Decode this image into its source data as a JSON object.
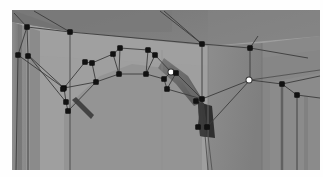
{
  "app": {
    "view_name": "3d-photogrammetry-viewport",
    "title": "Stone Archway Mesh Overlay",
    "description": "Oblique photograph of a masonry arch with an editable polygonal wireframe mesh overlaid; black square handles mark mesh vertices, white round handles mark the currently selected vertices."
  },
  "canvas": {
    "width": 323,
    "height": 177,
    "viewport_x": 12,
    "viewport_y": 10,
    "viewport_width": 308,
    "viewport_height": 160,
    "page_background": "#ffffff"
  },
  "palette": {
    "wall_face": "#9b9b9b",
    "wall_face_light": "#a6a6a6",
    "upper_band": "#7e7e7e",
    "upper_band_dark": "#767676",
    "left_pier": "#8a8a8a",
    "left_pier_dark": "#7c7c7c",
    "right_wall": "#8d8d8d",
    "right_wall_dark": "#828282",
    "right_return": "#898989",
    "soffit_shadow": "#6e6e6e",
    "voussoir_shadow": "#585858",
    "pier_shadow": "#3a3a3a",
    "dark_jamb": "#2e2e2e",
    "wire_stroke": "#3b3b3b",
    "wire_stroke_soft": "#4a4a4a",
    "vertex_fill": "#111111",
    "vertex_selected_fill": "#ffffff",
    "vertex_selected_stroke": "#282828"
  },
  "mesh": {
    "vertex_count": 30,
    "selected_vertex_count": 2,
    "vertices": [
      {
        "id": "v01",
        "x": 27,
        "y": 27,
        "state": "normal",
        "group": "upper-left-corner"
      },
      {
        "id": "v02",
        "x": 70,
        "y": 32,
        "state": "normal",
        "group": "upper-band"
      },
      {
        "id": "v03",
        "x": 18,
        "y": 55,
        "state": "normal",
        "group": "left-pier-top"
      },
      {
        "id": "v04",
        "x": 28,
        "y": 56,
        "state": "normal",
        "group": "left-pier-top"
      },
      {
        "id": "v05",
        "x": 64,
        "y": 88,
        "state": "normal",
        "group": "left-springer"
      },
      {
        "id": "v06",
        "x": 66,
        "y": 102,
        "state": "normal",
        "group": "left-springer"
      },
      {
        "id": "v07",
        "x": 68,
        "y": 111,
        "state": "normal",
        "group": "left-impost"
      },
      {
        "id": "v08",
        "x": 85,
        "y": 62,
        "state": "normal",
        "group": "arch-extrados"
      },
      {
        "id": "v09",
        "x": 92,
        "y": 63,
        "state": "normal",
        "group": "arch-extrados"
      },
      {
        "id": "v10",
        "x": 96,
        "y": 82,
        "state": "normal",
        "group": "arch-intrados"
      },
      {
        "id": "v11",
        "x": 113,
        "y": 54,
        "state": "normal",
        "group": "arch-extrados"
      },
      {
        "id": "v12",
        "x": 119,
        "y": 74,
        "state": "normal",
        "group": "arch-intrados"
      },
      {
        "id": "v13",
        "x": 120,
        "y": 48,
        "state": "normal",
        "group": "arch-crown"
      },
      {
        "id": "v14",
        "x": 148,
        "y": 50,
        "state": "normal",
        "group": "arch-crown"
      },
      {
        "id": "v15",
        "x": 146,
        "y": 74,
        "state": "normal",
        "group": "arch-intrados"
      },
      {
        "id": "v16",
        "x": 155,
        "y": 55,
        "state": "normal",
        "group": "arch-extrados"
      },
      {
        "id": "v17",
        "x": 164,
        "y": 79,
        "state": "normal",
        "group": "arch-intrados"
      },
      {
        "id": "v18",
        "x": 171,
        "y": 72,
        "state": "selected",
        "group": "arch-extrados"
      },
      {
        "id": "v19",
        "x": 176,
        "y": 73,
        "state": "normal",
        "group": "arch-extrados"
      },
      {
        "id": "v20",
        "x": 167,
        "y": 89,
        "state": "normal",
        "group": "arch-intrados"
      },
      {
        "id": "v21",
        "x": 202,
        "y": 44,
        "state": "normal",
        "group": "right-wall-top"
      },
      {
        "id": "v22",
        "x": 202,
        "y": 99,
        "state": "normal",
        "group": "right-springer"
      },
      {
        "id": "v23",
        "x": 198,
        "y": 127,
        "state": "normal",
        "group": "right-pier-base"
      },
      {
        "id": "v24",
        "x": 207,
        "y": 127,
        "state": "normal",
        "group": "right-pier-base"
      },
      {
        "id": "v25",
        "x": 250,
        "y": 48,
        "state": "normal",
        "group": "right-return-top"
      },
      {
        "id": "v26",
        "x": 249,
        "y": 80,
        "state": "selected",
        "group": "right-return"
      },
      {
        "id": "v27",
        "x": 282,
        "y": 84,
        "state": "normal",
        "group": "right-return"
      },
      {
        "id": "v28",
        "x": 297,
        "y": 95,
        "state": "normal",
        "group": "right-return"
      },
      {
        "id": "v29",
        "x": 63,
        "y": 89,
        "state": "normal",
        "group": "left-springer"
      },
      {
        "id": "v30",
        "x": 196,
        "y": 101,
        "state": "normal",
        "group": "right-springer"
      }
    ]
  },
  "labels": {
    "viewport_label": "viewport",
    "mesh_label": "mesh-overlay",
    "selected_label": "selected-vertex"
  }
}
